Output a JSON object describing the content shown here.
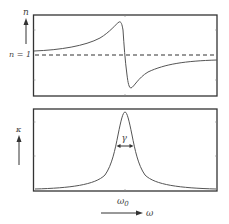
{
  "top_panel": {
    "y_label": "n",
    "reference_label": "n = 1",
    "curve": "refractive index n vs frequency (anomalous dispersion)",
    "reference_line": "dashed"
  },
  "bottom_panel": {
    "y_label": "κ",
    "width_label": "γ",
    "curve": "absorption κ vs frequency (Lorentzian peak)"
  },
  "x_axis": {
    "center_label": "ω0",
    "center_label_main": "ω",
    "center_label_sub": "0",
    "axis_label": "ω"
  },
  "colors": {
    "frame": "#333333",
    "curve": "#555555",
    "text": "#444444"
  }
}
